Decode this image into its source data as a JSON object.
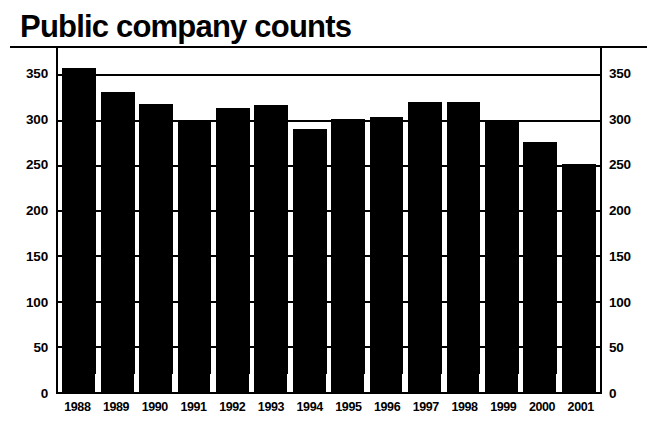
{
  "chart_data": {
    "type": "bar",
    "title": "Public company counts",
    "xlabel": "",
    "ylabel": "",
    "ylim": [
      0,
      400
    ],
    "ytick_step": 50,
    "grid": true,
    "legend": null,
    "axis_mirrored": true,
    "bar_color": "#000000",
    "background_color": "#ffffff",
    "categories": [
      "1988",
      "1989",
      "1990",
      "1991",
      "1992",
      "1993",
      "1994",
      "1995",
      "1996",
      "1997",
      "1998",
      "1999",
      "2000",
      "2001"
    ],
    "values": [
      358,
      332,
      318,
      301,
      314,
      317,
      291,
      302,
      304,
      320,
      320,
      301,
      276,
      252
    ],
    "yticks": [
      "0",
      "50",
      "100",
      "150",
      "200",
      "250",
      "300",
      "350",
      "400"
    ],
    "ytick_values": [
      0,
      50,
      100,
      150,
      200,
      250,
      300,
      350,
      400
    ]
  }
}
